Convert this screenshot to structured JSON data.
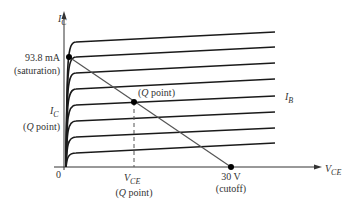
{
  "diagram": {
    "colors": {
      "curve": "#1a1a1a",
      "axis": "#333333",
      "load_line": "#555555",
      "text": "#333333",
      "point": "#000000"
    },
    "axes": {
      "y_label_main": "I",
      "y_label_sub": "C",
      "x_label_main": "V",
      "x_label_sub": "CE",
      "origin_label": "0"
    },
    "annotations": {
      "saturation_value": "93.8 mA",
      "saturation_note": "(saturation)",
      "ic_q_main": "I",
      "ic_q_sub": "C",
      "ic_q_note": "(Q point)",
      "q_point_label": "(Q point)",
      "vce_q_main": "V",
      "vce_q_sub": "CE",
      "vce_q_note": "(Q point)",
      "cutoff_value": "30 V",
      "cutoff_note": "(cutoff)",
      "ib_main": "I",
      "ib_sub": "B"
    },
    "points": {
      "saturation": {
        "x": 0,
        "y_mA": 93.8
      },
      "cutoff": {
        "x_V": 30,
        "y": 0
      },
      "q_point": "intersection of load line with I_B curve"
    },
    "curve_count": 8
  }
}
